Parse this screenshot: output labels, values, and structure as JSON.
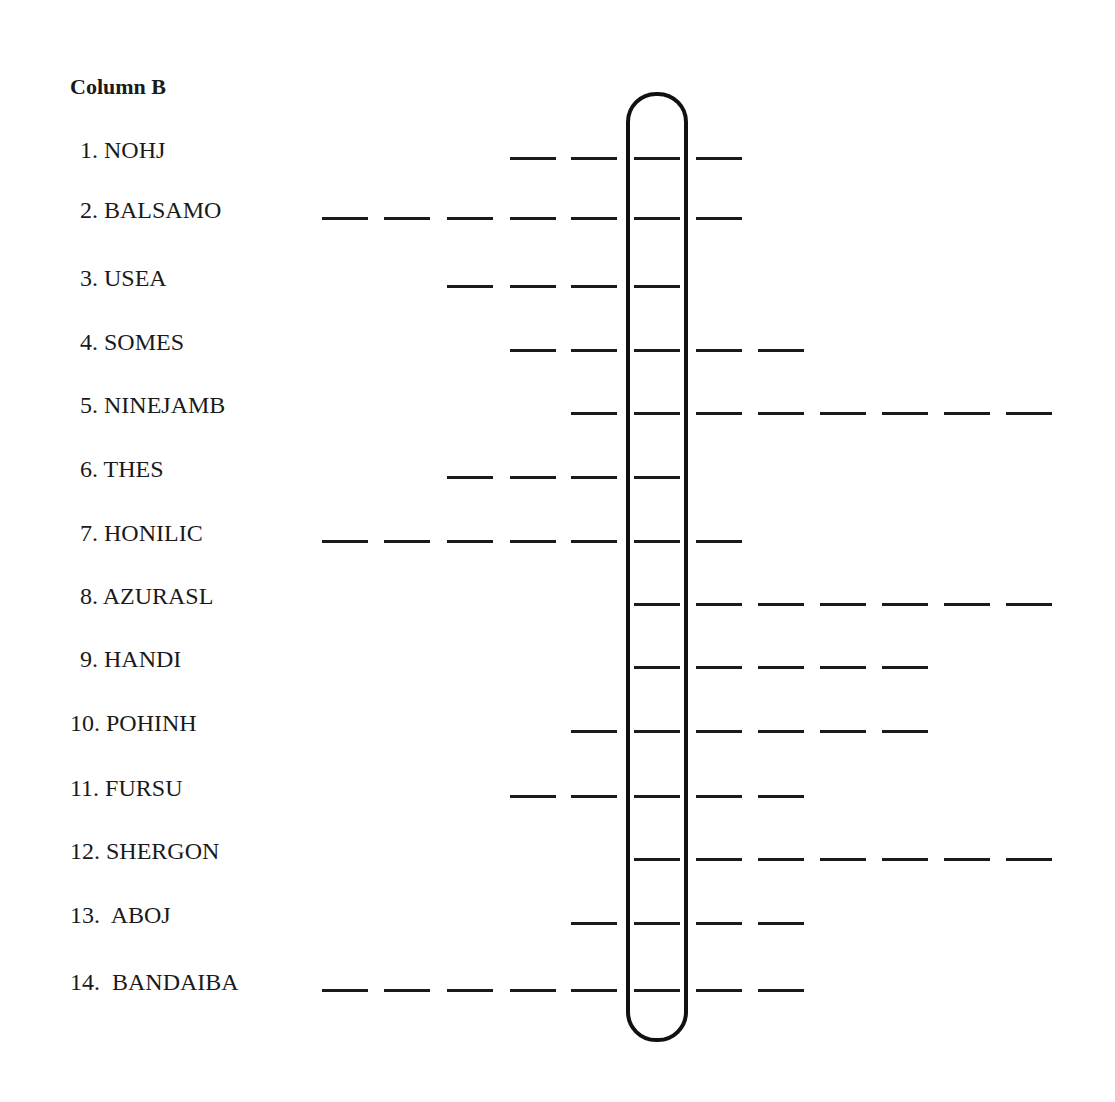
{
  "heading": "Column B",
  "layout": {
    "slot_x": [
      322,
      384,
      447,
      510,
      571,
      634,
      696,
      758,
      820,
      882,
      944,
      1006
    ],
    "highlight_slot": 5
  },
  "items": [
    {
      "number": "1.",
      "word": "NOHJ",
      "y": 158,
      "first_slot": 3,
      "last_slot": 6
    },
    {
      "number": "2.",
      "word": "BALSAMO",
      "y": 218,
      "first_slot": 0,
      "last_slot": 6
    },
    {
      "number": "3.",
      "word": "USEA",
      "y": 286,
      "first_slot": 2,
      "last_slot": 5
    },
    {
      "number": "4.",
      "word": "SOMES",
      "y": 350,
      "first_slot": 3,
      "last_slot": 7
    },
    {
      "number": "5.",
      "word": "NINEJAMB",
      "y": 413,
      "first_slot": 4,
      "last_slot": 11
    },
    {
      "number": "6.",
      "word": "THES",
      "y": 477,
      "first_slot": 2,
      "last_slot": 5
    },
    {
      "number": "7.",
      "word": "HONILIC",
      "y": 541,
      "first_slot": 0,
      "last_slot": 6
    },
    {
      "number": "8.",
      "word": "AZURASL",
      "y": 604,
      "first_slot": 5,
      "last_slot": 11
    },
    {
      "number": "9.",
      "word": "HANDI",
      "y": 667,
      "first_slot": 5,
      "last_slot": 9
    },
    {
      "number": "10.",
      "word": "POHINH",
      "y": 731,
      "first_slot": 4,
      "last_slot": 9
    },
    {
      "number": "11.",
      "word": "FURSU",
      "y": 796,
      "first_slot": 3,
      "last_slot": 7
    },
    {
      "number": "12.",
      "word": "SHERGON",
      "y": 859,
      "first_slot": 5,
      "last_slot": 11
    },
    {
      "number": "13.",
      "word": "ABOJ",
      "y": 923,
      "first_slot": 4,
      "last_slot": 7
    },
    {
      "number": "14.",
      "word": "BANDAIBA",
      "y": 990,
      "first_slot": 0,
      "last_slot": 7
    }
  ]
}
